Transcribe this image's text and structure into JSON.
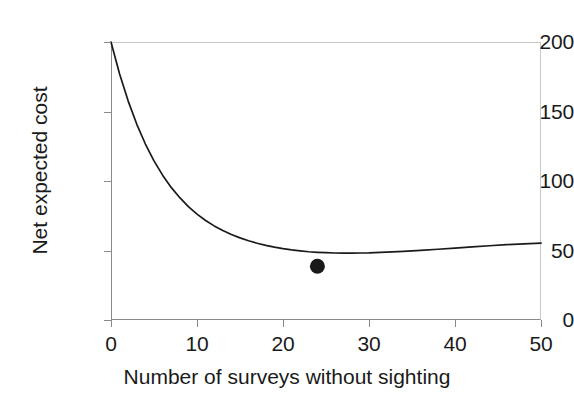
{
  "chart_data": {
    "type": "line",
    "title": "",
    "xlabel": "Number of surveys without sighting",
    "ylabel": "Net expected cost",
    "xlim": [
      0,
      50
    ],
    "ylim": [
      0,
      200
    ],
    "xticks": [
      0,
      10,
      20,
      30,
      40,
      50
    ],
    "yticks": [
      0,
      50,
      100,
      150,
      200
    ],
    "grid": false,
    "legend": null,
    "series": [
      {
        "name": "Net expected cost",
        "color": "#1a1a1a",
        "x": [
          0,
          1,
          2,
          3,
          4,
          5,
          6,
          7,
          8,
          9,
          10,
          11,
          12,
          13,
          14,
          15,
          16,
          17,
          18,
          19,
          20,
          21,
          22,
          23,
          24,
          25,
          26,
          27,
          28,
          29,
          30,
          32,
          34,
          36,
          38,
          40,
          42,
          44,
          46,
          48,
          50
        ],
        "y": [
          200.0,
          177.0,
          157.5,
          140.8,
          126.6,
          114.5,
          104.2,
          95.4,
          88.0,
          81.6,
          76.2,
          71.6,
          67.7,
          64.4,
          61.5,
          59.1,
          57.0,
          55.2,
          53.7,
          52.4,
          51.3,
          50.4,
          49.7,
          49.1,
          48.7,
          48.4,
          48.2,
          48.1,
          48.1,
          48.2,
          48.3,
          48.8,
          49.4,
          50.1,
          50.9,
          51.7,
          52.6,
          53.4,
          54.2,
          54.8,
          55.3
        ]
      }
    ],
    "markers": [
      {
        "name": "optimum-point",
        "x": 24,
        "y": 38.7,
        "color": "#1a1a1a",
        "shape": "filled-circle"
      }
    ]
  },
  "axes": {
    "y_tick_labels": [
      "200",
      "150",
      "100",
      "50",
      "0"
    ],
    "x_tick_labels": [
      "0",
      "10",
      "20",
      "30",
      "40",
      "50"
    ],
    "y_title": "Net expected cost",
    "x_title": "Number of surveys without sighting"
  },
  "colors": {
    "curve": "#1a1a1a",
    "marker": "#1a1a1a",
    "axis": "#8a8a8a",
    "frame_light": "#c9c9c9",
    "text": "#1a1a1a",
    "background": "#ffffff"
  }
}
